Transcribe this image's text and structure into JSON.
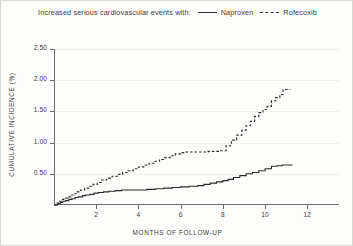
{
  "legend": {
    "caption": "Increased serious cardiovascular events with:",
    "entries": [
      {
        "label": "Naproxen",
        "style": "solid",
        "icon": "solid-line-icon"
      },
      {
        "label": "Rofecoxib",
        "style": "dashed",
        "icon": "dashed-line-icon"
      }
    ]
  },
  "chart_data": {
    "type": "line",
    "title": "",
    "subtitle": "",
    "xlabel": "MONTHS OF FOLLOW-UP",
    "ylabel": "CUMULATIVE INCIDENCE (%)",
    "xlim": [
      0,
      13.5
    ],
    "ylim": [
      0,
      2.5
    ],
    "xticks": [
      2,
      4,
      6,
      8,
      10,
      12
    ],
    "xtick_labels": [
      "2",
      "4",
      "6",
      "8",
      "10",
      "12"
    ],
    "yticks": [
      0.5,
      1.0,
      1.5,
      2.0,
      2.5
    ],
    "ytick_labels": [
      "0.50",
      "1.00",
      "1.50",
      "2.00",
      "2.50"
    ],
    "grid": true,
    "legend_position": "top-center",
    "line_color": "#2b2b2b",
    "grid_color": "#f0efe9",
    "axis_color": "#6e6e6e",
    "step_type": "post",
    "series": [
      {
        "name": "Naproxen",
        "style": "solid",
        "x": [
          0.0,
          0.18,
          0.3,
          0.42,
          0.55,
          0.7,
          0.85,
          1.0,
          1.15,
          1.35,
          1.5,
          1.7,
          1.9,
          2.1,
          2.35,
          2.6,
          2.9,
          3.2,
          3.6,
          4.0,
          4.4,
          4.8,
          5.2,
          5.6,
          6.0,
          6.4,
          6.8,
          7.1,
          7.4,
          7.7,
          8.0,
          8.25,
          8.5,
          8.8,
          9.1,
          9.4,
          9.7,
          10.0,
          10.3,
          10.55,
          10.8,
          11.3
        ],
        "y": [
          0.0,
          0.02,
          0.04,
          0.06,
          0.07,
          0.09,
          0.1,
          0.12,
          0.13,
          0.15,
          0.16,
          0.17,
          0.19,
          0.2,
          0.21,
          0.22,
          0.23,
          0.24,
          0.24,
          0.24,
          0.25,
          0.26,
          0.27,
          0.28,
          0.29,
          0.3,
          0.31,
          0.33,
          0.35,
          0.37,
          0.39,
          0.41,
          0.44,
          0.47,
          0.5,
          0.52,
          0.55,
          0.58,
          0.62,
          0.63,
          0.64,
          0.64
        ]
      },
      {
        "name": "Rofecoxib",
        "style": "dashed",
        "x": [
          0.0,
          0.15,
          0.28,
          0.4,
          0.52,
          0.65,
          0.8,
          0.95,
          1.1,
          1.25,
          1.45,
          1.65,
          1.85,
          2.05,
          2.25,
          2.5,
          2.75,
          3.0,
          3.25,
          3.5,
          3.75,
          4.0,
          4.25,
          4.5,
          4.75,
          5.0,
          5.25,
          5.5,
          5.75,
          6.0,
          6.25,
          6.5,
          6.75,
          7.0,
          7.3,
          7.6,
          7.9,
          8.15,
          8.4,
          8.65,
          8.9,
          9.1,
          9.3,
          9.5,
          9.7,
          9.9,
          10.1,
          10.3,
          10.5,
          10.7,
          10.85,
          11.2
        ],
        "y": [
          0.0,
          0.03,
          0.06,
          0.09,
          0.11,
          0.13,
          0.16,
          0.18,
          0.21,
          0.24,
          0.27,
          0.3,
          0.33,
          0.36,
          0.4,
          0.43,
          0.46,
          0.49,
          0.52,
          0.55,
          0.58,
          0.61,
          0.64,
          0.67,
          0.7,
          0.73,
          0.76,
          0.79,
          0.82,
          0.84,
          0.85,
          0.85,
          0.85,
          0.85,
          0.86,
          0.86,
          0.87,
          0.95,
          1.04,
          1.12,
          1.2,
          1.27,
          1.34,
          1.42,
          1.48,
          1.53,
          1.58,
          1.67,
          1.72,
          1.77,
          1.85,
          1.85
        ]
      }
    ]
  }
}
